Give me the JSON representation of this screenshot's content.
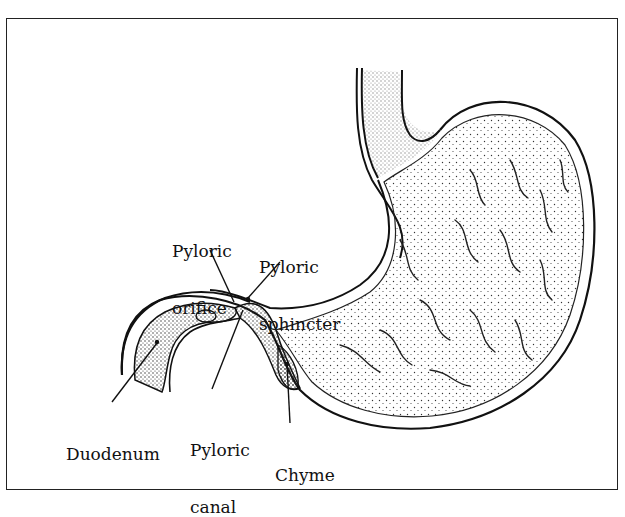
{
  "diagram": {
    "labels": [
      {
        "id": "pyloric-orifice",
        "line1": "Pyloric",
        "line2": "orifice"
      },
      {
        "id": "pyloric-sphincter",
        "line1": "Pyloric",
        "line2": "sphincter"
      },
      {
        "id": "duodenum",
        "line1": "Duodenum"
      },
      {
        "id": "pyloric-canal",
        "line1": "Pyloric",
        "line2": "canal"
      },
      {
        "id": "chyme",
        "line1": "Chyme"
      }
    ],
    "colors": {
      "ink": "#111111",
      "background": "#ffffff"
    }
  }
}
